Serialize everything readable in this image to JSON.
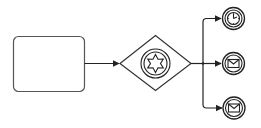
{
  "diagram": {
    "type": "BPMN",
    "colors": {
      "stroke": "#222222",
      "task_stroke": "#555555",
      "background": "#ffffff"
    },
    "nodes": [
      {
        "id": "task",
        "kind": "task",
        "label": ""
      },
      {
        "id": "gateway",
        "kind": "event-based-gateway",
        "icon": "star-icon",
        "label": ""
      },
      {
        "id": "event-timer",
        "kind": "intermediate-catch-event",
        "icon": "clock-icon",
        "label": ""
      },
      {
        "id": "event-message-1",
        "kind": "intermediate-catch-event",
        "icon": "envelope-icon",
        "label": ""
      },
      {
        "id": "event-message-2",
        "kind": "intermediate-catch-event",
        "icon": "envelope-icon",
        "label": ""
      }
    ],
    "flows": [
      {
        "from": "task",
        "to": "gateway"
      },
      {
        "from": "gateway",
        "to": "event-timer"
      },
      {
        "from": "gateway",
        "to": "event-message-1"
      },
      {
        "from": "gateway",
        "to": "event-message-2"
      }
    ]
  }
}
